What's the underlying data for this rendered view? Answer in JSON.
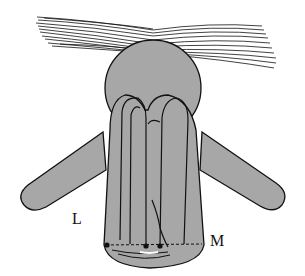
{
  "figure": {
    "colors": {
      "body_fill": "#a7a7a7",
      "outline": "#111111",
      "background": "#ffffff"
    },
    "labels": [
      {
        "id": "L",
        "text": "L"
      },
      {
        "id": "M",
        "text": "M"
      }
    ]
  }
}
